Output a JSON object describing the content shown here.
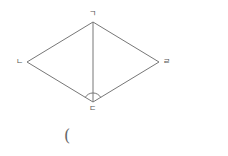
{
  "diagram": {
    "type": "rhombus",
    "vertices": [
      {
        "id": "A",
        "label": "ㄱ",
        "x": 93,
        "y": 22
      },
      {
        "id": "B",
        "label": "ㄴ",
        "x": 27,
        "y": 62
      },
      {
        "id": "C",
        "label": "ㄷ",
        "x": 93,
        "y": 102
      },
      {
        "id": "D",
        "label": "ㄹ",
        "x": 159,
        "y": 62
      }
    ],
    "edges": [
      [
        "A",
        "B"
      ],
      [
        "B",
        "C"
      ],
      [
        "C",
        "D"
      ],
      [
        "D",
        "A"
      ],
      [
        "A",
        "C"
      ]
    ],
    "angle_marks": [
      {
        "at": "C",
        "between": [
          "B",
          "D"
        ]
      }
    ],
    "stroke_color": "#777777"
  },
  "labels": {
    "top": "ㄱ",
    "left": "ㄴ",
    "bottom": "ㄷ",
    "right": "ㄹ"
  },
  "answer_blank": {
    "open_paren": "("
  }
}
